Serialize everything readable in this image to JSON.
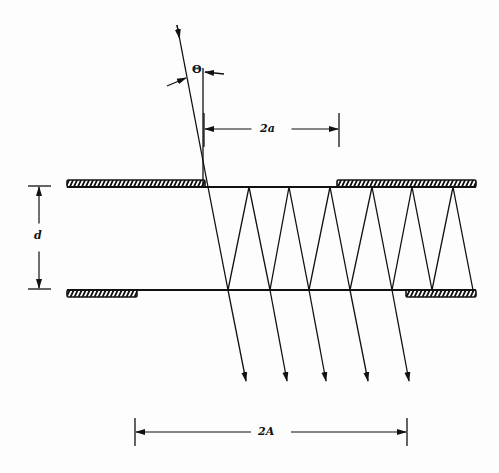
{
  "diagram": {
    "colors": {
      "ink": "#111111",
      "background": "#fdfdfd"
    },
    "labels": {
      "theta": "Θ",
      "two_a": "2a",
      "d": "d",
      "two_A": "2A"
    },
    "slab": {
      "top_y": 187,
      "bottom_y": 290,
      "left_x": 67,
      "right_x": 476
    },
    "hatched_bars": [
      {
        "name": "top-left-screen",
        "x1": 67,
        "x2": 205,
        "y": 180,
        "h": 7
      },
      {
        "name": "top-right-screen",
        "x1": 337,
        "x2": 476,
        "y": 180,
        "h": 7
      },
      {
        "name": "bottom-left-screen",
        "x1": 67,
        "x2": 137,
        "y": 290,
        "h": 7
      },
      {
        "name": "bottom-right-screen",
        "x1": 406,
        "x2": 476,
        "y": 290,
        "h": 7
      }
    ],
    "incident_ray": {
      "x1": 177,
      "y1": 25,
      "x2": 208,
      "y2": 187,
      "arrow_at": 0.06
    },
    "zigzag_points": [
      [
        208,
        187
      ],
      [
        228,
        290
      ],
      [
        249,
        187
      ],
      [
        270,
        290
      ],
      [
        289,
        187
      ],
      [
        309,
        290
      ],
      [
        330,
        187
      ],
      [
        350,
        290
      ],
      [
        372,
        187
      ],
      [
        392,
        290
      ],
      [
        412,
        187
      ],
      [
        432,
        290
      ],
      [
        453,
        187
      ],
      [
        473,
        290
      ]
    ],
    "transmitted_rays": [
      {
        "x1": 228,
        "y1": 290,
        "x2": 246,
        "y2": 381
      },
      {
        "x1": 270,
        "y1": 290,
        "x2": 287,
        "y2": 381
      },
      {
        "x1": 309,
        "y1": 290,
        "x2": 326,
        "y2": 381
      },
      {
        "x1": 350,
        "y1": 290,
        "x2": 368,
        "y2": 381
      },
      {
        "x1": 392,
        "y1": 290,
        "x2": 409,
        "y2": 381
      }
    ],
    "angle_marker": {
      "normal_x": 203,
      "normal_y1": 68,
      "normal_y2": 187,
      "left_arrow": {
        "x1": 167,
        "y1": 86,
        "x2": 186,
        "y2": 78
      },
      "right_arrow": {
        "x1": 224,
        "y1": 74,
        "x2": 205,
        "y2": 72
      },
      "label_x": 190,
      "label_y": 64
    },
    "dim_2a": {
      "x1": 204,
      "x2": 339,
      "y": 129,
      "tick_y1": 113,
      "tick_y2": 147,
      "label_x": 262,
      "label_y": 123
    },
    "dim_d": {
      "x": 39,
      "y1": 186,
      "y2": 289,
      "tick_x1": 28,
      "tick_x2": 51,
      "label_x": 34,
      "label_y": 230
    },
    "dim_2A": {
      "x1": 135,
      "x2": 407,
      "y": 432,
      "tick_y1": 418,
      "tick_y2": 446,
      "label_x": 262,
      "label_y": 426
    }
  }
}
